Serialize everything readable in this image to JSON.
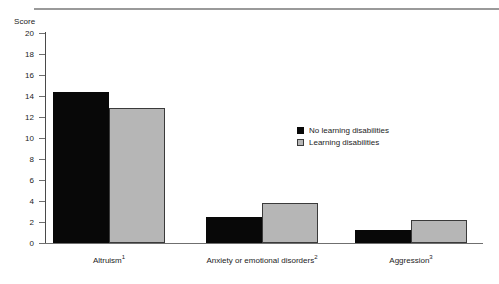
{
  "header": {
    "rule_visible": true
  },
  "chart_data": {
    "type": "bar",
    "title": "",
    "subtitle": "",
    "xlabel": "",
    "ylabel": "Score",
    "ylim": [
      0,
      20
    ],
    "ytick_step": 2,
    "yticks": [
      "20",
      "18",
      "16",
      "14",
      "12",
      "10",
      "8",
      "6",
      "4",
      "2",
      "0"
    ],
    "grid": false,
    "legend_position": "center-right",
    "categories": [
      "Altruism¹",
      "Anxiety or emotional disorders²",
      "Aggression³"
    ],
    "category_labels": [
      {
        "text": "Altruism",
        "note": "1"
      },
      {
        "text": "Anxiety or emotional disorders",
        "note": "2"
      },
      {
        "text": "Aggression",
        "note": "3"
      }
    ],
    "series": [
      {
        "name": "No learning disabilities",
        "color": "#080808",
        "values": [
          14.4,
          2.5,
          1.2
        ]
      },
      {
        "name": "Learning disabilities",
        "color": "#b6b6b6",
        "values": [
          12.9,
          3.8,
          2.2
        ]
      }
    ]
  },
  "legend": {
    "items": [
      {
        "label": "No learning disabilities",
        "swatch": "black"
      },
      {
        "label": "Learning disabilities",
        "swatch": "gray"
      }
    ]
  }
}
